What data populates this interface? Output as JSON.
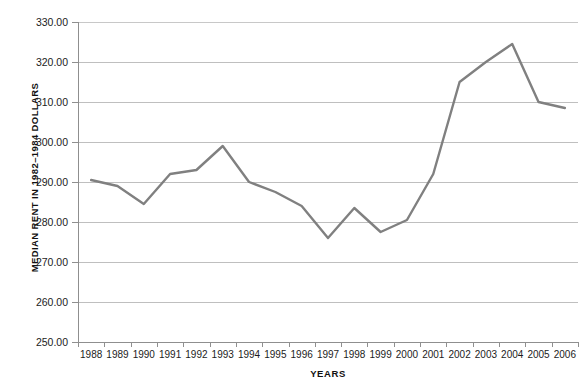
{
  "chart_data": {
    "type": "line",
    "title": "",
    "xlabel": "YEARS",
    "ylabel": "MEDIAN RENT IN 1982–1984 DOLLARS",
    "categories": [
      "1988",
      "1989",
      "1990",
      "1991",
      "1992",
      "1993",
      "1994",
      "1995",
      "1996",
      "1997",
      "1998",
      "1999",
      "2000",
      "2001",
      "2002",
      "2003",
      "2004",
      "2005",
      "2006"
    ],
    "values": [
      290.5,
      289.0,
      284.5,
      292.0,
      293.0,
      299.0,
      290.0,
      287.5,
      284.0,
      276.0,
      283.5,
      277.5,
      280.5,
      292.0,
      315.0,
      320.0,
      324.5,
      310.0,
      308.5
    ],
    "series": [
      {
        "name": "Median rent",
        "values": [
          290.5,
          289.0,
          284.5,
          292.0,
          293.0,
          299.0,
          290.0,
          287.5,
          284.0,
          276.0,
          283.5,
          277.5,
          280.5,
          292.0,
          315.0,
          320.0,
          324.5,
          310.0,
          308.5
        ]
      }
    ],
    "ylim": [
      250,
      330
    ],
    "ytick_step": 10,
    "ytick_labels": [
      "330.00",
      "320.00",
      "310.00",
      "300.00",
      "290.00",
      "280.00",
      "270.00",
      "260.00",
      "250.00"
    ],
    "ytick_values": [
      330,
      320,
      310,
      300,
      290,
      280,
      270,
      260,
      250
    ],
    "grid": true,
    "legend": false,
    "legend_position": "none",
    "line_color": "#808080",
    "grid_color": "#bfbfbf",
    "axis_color": "#8f8f8f",
    "background_color": "#ffffff",
    "line_width": 2.4
  }
}
